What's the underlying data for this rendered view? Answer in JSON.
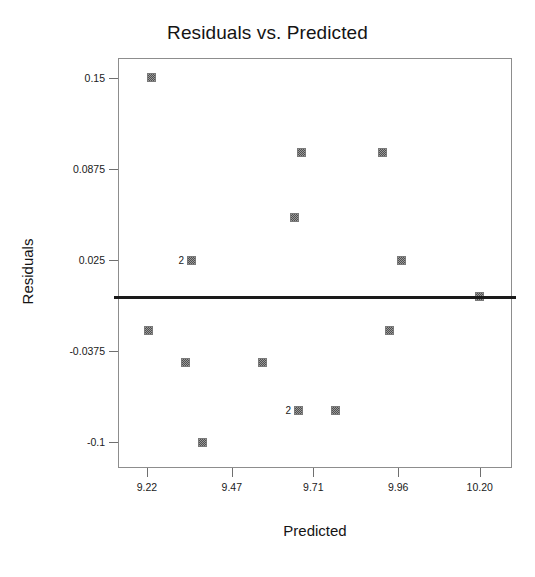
{
  "chart_data": {
    "type": "scatter",
    "title": "Residuals vs. Predicted",
    "xlabel": "Predicted",
    "ylabel": "Residuals",
    "xlim": [
      9.135,
      10.295
    ],
    "ylim": [
      -0.1175,
      0.1635
    ],
    "xticks": [
      9.22,
      9.47,
      9.71,
      9.96,
      10.2
    ],
    "xtick_labels": [
      "9.22",
      "9.47",
      "9.71",
      "9.96",
      "10.20"
    ],
    "yticks": [
      0.15,
      0.0875,
      0.025,
      -0.0375,
      -0.1
    ],
    "ytick_labels": [
      "0.15",
      "0.0875",
      "0.025",
      "-0.0375",
      "-0.1"
    ],
    "grid": false,
    "legend": null,
    "reference_line": {
      "orientation": "horizontal",
      "y": 0.0,
      "color": "#1a1a1a"
    },
    "marker_style": "filled-square-dithered-gray",
    "marker_color": "#9a9a9a",
    "points": [
      {
        "x": 9.235,
        "y": 0.15,
        "count": 1,
        "label": ""
      },
      {
        "x": 9.675,
        "y": 0.0985,
        "count": 1,
        "label": ""
      },
      {
        "x": 9.915,
        "y": 0.0985,
        "count": 1,
        "label": ""
      },
      {
        "x": 9.655,
        "y": 0.0545,
        "count": 1,
        "label": ""
      },
      {
        "x": 9.35,
        "y": 0.025,
        "count": 2,
        "label": "2"
      },
      {
        "x": 9.97,
        "y": 0.025,
        "count": 1,
        "label": ""
      },
      {
        "x": 10.2,
        "y": 0.0,
        "count": 1,
        "label": ""
      },
      {
        "x": 9.225,
        "y": -0.0235,
        "count": 1,
        "label": ""
      },
      {
        "x": 9.935,
        "y": -0.0235,
        "count": 1,
        "label": ""
      },
      {
        "x": 9.335,
        "y": -0.0455,
        "count": 1,
        "label": ""
      },
      {
        "x": 9.56,
        "y": -0.0455,
        "count": 1,
        "label": ""
      },
      {
        "x": 9.665,
        "y": -0.078,
        "count": 2,
        "label": "2"
      },
      {
        "x": 9.775,
        "y": -0.078,
        "count": 1,
        "label": ""
      },
      {
        "x": 9.385,
        "y": -0.1,
        "count": 1,
        "label": ""
      }
    ]
  }
}
